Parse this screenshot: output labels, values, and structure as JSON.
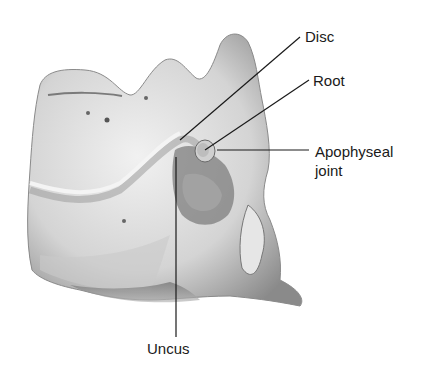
{
  "figure": {
    "labels": [
      {
        "id": "disc",
        "text": "Disc"
      },
      {
        "id": "root",
        "text": "Root"
      },
      {
        "id": "apophyseal_1",
        "text": "Apophyseal"
      },
      {
        "id": "apophyseal_2",
        "text": "joint"
      },
      {
        "id": "uncus",
        "text": "Uncus"
      }
    ]
  }
}
